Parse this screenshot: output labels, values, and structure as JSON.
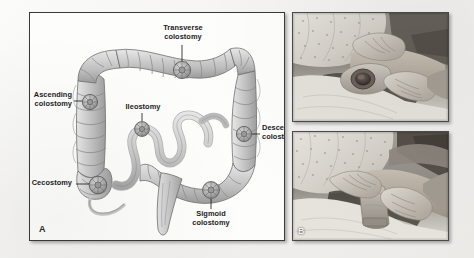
{
  "figure": {
    "background_color": "#f2f1ef",
    "panels": [
      {
        "letter": "A",
        "kind": "illustration",
        "description": "Line drawing of the large intestine showing common ostomy sites"
      },
      {
        "letter": "B",
        "kind": "photograph",
        "description": "Clinical photographs of a nurse applying an ostomy pouch to a patient"
      }
    ]
  },
  "panel_a": {
    "letter": "A",
    "labels": [
      {
        "id": "transverse-colostomy",
        "text_line1": "Transverse",
        "text_line2": "colostomy"
      },
      {
        "id": "ascending-colostomy",
        "text_line1": "Ascending",
        "text_line2": "colostomy"
      },
      {
        "id": "descending-colostomy",
        "text_line1": "Descending",
        "text_line2": "colostomy"
      },
      {
        "id": "sigmoid-colostomy",
        "text_line1": "Sigmoid",
        "text_line2": "colostomy"
      },
      {
        "id": "ileostomy",
        "text_line1": "Ileostomy",
        "text_line2": ""
      },
      {
        "id": "cecostomy",
        "text_line1": "Cecostomy",
        "text_line2": ""
      }
    ],
    "label_text": {
      "transverse_1": "Transverse",
      "transverse_2": "colostomy",
      "ascending_1": "Ascending",
      "ascending_2": "colostomy",
      "descending_1": "Descending",
      "descending_2": "colostomy",
      "sigmoid_1": "Sigmoid",
      "sigmoid_2": "colostomy",
      "ileostomy_1": "Ileostomy",
      "cecostomy_1": "Cecostomy"
    },
    "colors": {
      "bowel_fill": "#c9c9c9",
      "bowel_outline": "#6e6e6e",
      "stoma_fill": "#a9a9a9",
      "leader_line": "#2a2a2a",
      "panel_background": "#fdfdfc",
      "panel_border": "#3a3a3c"
    }
  },
  "panel_b": {
    "letter": "B",
    "photos": [
      {
        "id": "photo-top",
        "caption": ""
      },
      {
        "id": "photo-bottom",
        "caption": ""
      }
    ],
    "colors": {
      "border": "#4a4a4c",
      "gown": "#dcdad4",
      "skin": "#b9b1a6",
      "glove": "#cfcac2",
      "stoma": "#5c5550"
    }
  }
}
